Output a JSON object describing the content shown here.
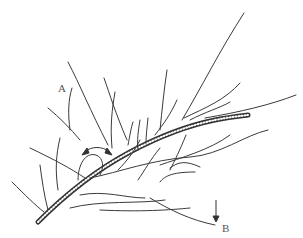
{
  "figure": {
    "type": "botanical line drawing",
    "labels": {
      "a": "A",
      "b": "B"
    },
    "annotations": {
      "curved_double_arrow": "bend marker on main stem",
      "down_arrow": "points to tip B"
    },
    "colors": {
      "ink": "#333333",
      "background": "#ffffff"
    }
  }
}
